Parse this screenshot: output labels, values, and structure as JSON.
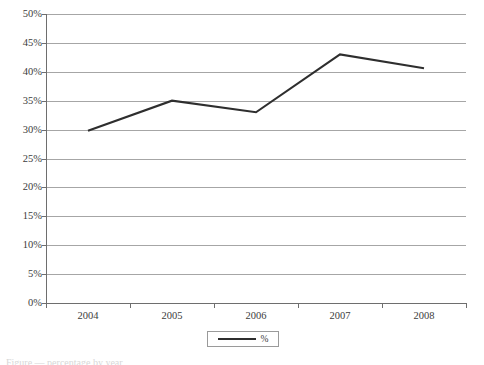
{
  "chart_data": {
    "type": "line",
    "title": "",
    "xlabel": "",
    "ylabel": "",
    "categories": [
      "2004",
      "2005",
      "2006",
      "2007",
      "2008"
    ],
    "series": [
      {
        "name": "%",
        "values": [
          29.8,
          35.0,
          33.0,
          43.0,
          40.6
        ],
        "color": "#2e2e2e"
      }
    ],
    "ylim": [
      0,
      50
    ],
    "ytick_step": 5,
    "ytick_labels": [
      "0%",
      "5%",
      "10%",
      "15%",
      "20%",
      "25%",
      "30%",
      "35%",
      "40%",
      "45%",
      "50%"
    ],
    "yticks": [
      0,
      5,
      10,
      15,
      20,
      25,
      30,
      35,
      40,
      45,
      50
    ],
    "value_suffix": "%",
    "grid": true,
    "grid_axis": "y",
    "grid_color": "#a6a6a6",
    "axis_color": "#6e6e6e",
    "legend": {
      "position": "bottom",
      "entries": [
        {
          "label": "%",
          "color": "#2e2e2e"
        }
      ]
    }
  },
  "caption": {
    "text": "Figure — percentage by year"
  }
}
